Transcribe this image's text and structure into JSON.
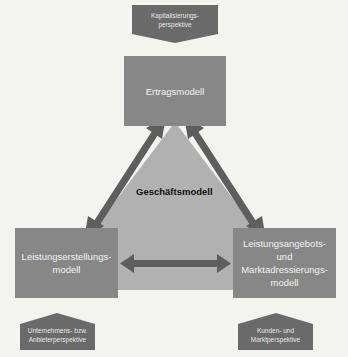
{
  "diagram": {
    "center": {
      "label": "Geschäftsmodell"
    },
    "models": {
      "top": {
        "label": "Ertragsmodell"
      },
      "left": {
        "label": "Leistungserstellungs-\nmodell",
        "line1": "Leistungserstellungs-",
        "line2": "modell"
      },
      "right": {
        "line1": "Leistungsangebots-",
        "line2": "und",
        "line3": "Marktadressierungs-",
        "line4": "modell"
      }
    },
    "perspectives": {
      "top": {
        "line1": "Kapitalisierungs-",
        "line2": "perspektive"
      },
      "left": {
        "line1": "Unternehmens- bzw.",
        "line2": "Anbieterperspektive"
      },
      "right": {
        "line1": "Kunden- und",
        "line2": "Marktperspektive"
      }
    },
    "colors": {
      "background": "#f3f3f1",
      "triangle": "#b1b1b1",
      "model_box": "#878787",
      "perspective": "#6a6a6a",
      "arrow": "#5e5e5e"
    }
  }
}
